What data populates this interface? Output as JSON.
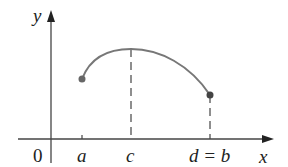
{
  "axes": {
    "y_label": "y",
    "x_label": "x",
    "origin_label": "0"
  },
  "ticks": [
    {
      "label": "a",
      "x": 82
    },
    {
      "label": "c",
      "x": 131
    },
    {
      "label": "d = b",
      "x": 210
    }
  ],
  "curve": {
    "start": {
      "x": 82,
      "y": 79
    },
    "peak": {
      "x": 131,
      "y": 49
    },
    "end": {
      "x": 210,
      "y": 95
    }
  },
  "colors": {
    "axis": "#444444",
    "curve": "#777777",
    "dot": "#666666"
  }
}
